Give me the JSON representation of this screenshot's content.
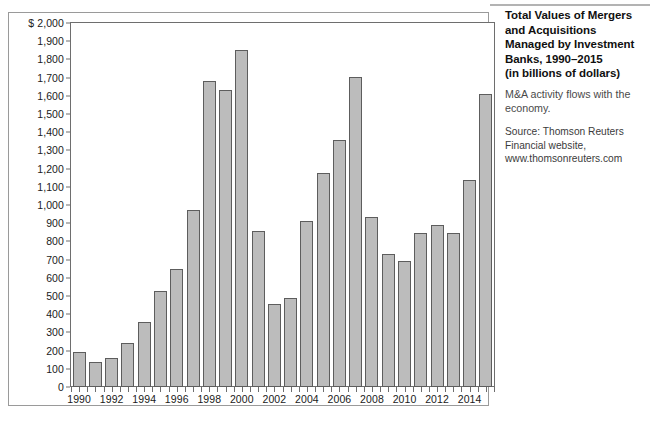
{
  "figure": {
    "caption": {
      "title_lines": [
        "Total Values of Mergers",
        "and Acquisitions",
        "Managed by Investment",
        "Banks, 1990–2015",
        "(in billions of dollars)"
      ],
      "subtitle": "M&A activity flows with the economy.",
      "source_lines": [
        "Source: Thomson Reuters",
        "Financial website,",
        "www.thomsonreuters.com"
      ]
    },
    "colors": {
      "bar_fill": "#bcbcbc",
      "bar_stroke": "#5d5d5d",
      "axis": "#6e6e6e",
      "frame": "#9a9a9a",
      "text": "#1a1a1a"
    }
  },
  "chart_data": {
    "type": "bar",
    "xlabel": "",
    "ylabel": "",
    "y_axis_prefix": "$",
    "ylim": [
      0,
      2000
    ],
    "y_tick_step": 100,
    "grid": false,
    "legend": null,
    "y_tick_labels": [
      "$ 2,000",
      "1,900",
      "1,800",
      "1,700",
      "1,600",
      "1,500",
      "1,400",
      "1,300",
      "1,200",
      "1,100",
      "1,000",
      "900",
      "800",
      "700",
      "600",
      "500",
      "400",
      "300",
      "200",
      "100",
      "0"
    ],
    "y_tick_values": [
      2000,
      1900,
      1800,
      1700,
      1600,
      1500,
      1400,
      1300,
      1200,
      1100,
      1000,
      900,
      800,
      700,
      600,
      500,
      400,
      300,
      200,
      100,
      0
    ],
    "x_tick_labels": [
      "1990",
      "1992",
      "1994",
      "1996",
      "1998",
      "2000",
      "2002",
      "2004",
      "2006",
      "2008",
      "2010",
      "2012",
      "2014"
    ],
    "categories": [
      "1990",
      "1991",
      "1992",
      "1993",
      "1994",
      "1995",
      "1996",
      "1997",
      "1998",
      "1999",
      "2000",
      "2001",
      "2002",
      "2003",
      "2004",
      "2005",
      "2006",
      "2007",
      "2008",
      "2009",
      "2010",
      "2011",
      "2012",
      "2013",
      "2014",
      "2015"
    ],
    "values": [
      190,
      140,
      160,
      240,
      355,
      530,
      650,
      975,
      1680,
      1630,
      1850,
      855,
      455,
      490,
      910,
      1175,
      1355,
      1705,
      935,
      730,
      690,
      845,
      890,
      845,
      1140,
      1610
    ]
  }
}
